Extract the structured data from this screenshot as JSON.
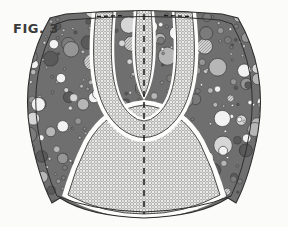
{
  "figure": {
    "label": "FIG. 3",
    "label_name": "figure-number-label",
    "caption_visible": true
  },
  "canvas": {
    "width": 288,
    "height": 227,
    "background_color": "#fbfbf9"
  },
  "colors": {
    "background": "#fbfbf9",
    "outline": "#2e2e2e",
    "aggregate_matrix": "#6f6f6f",
    "aggregate_dark": "#5a5a5a",
    "aggregate_mid": "#8d8d8d",
    "aggregate_light": "#c9c9c9",
    "aggregate_white": "#fafafa",
    "stipple_fill": "#ededea",
    "stipple_dot": "#8b8b8b",
    "white_band": "#fdfdfc",
    "centerline": "#1a1a1a"
  },
  "regions": [
    {
      "id": "outer-shell-left",
      "name": "aggregate-region-left",
      "fill": "aggregate",
      "description": "Left lobe filled with randomly sized circular aggregate particles"
    },
    {
      "id": "outer-shell-right",
      "name": "aggregate-region-right",
      "fill": "aggregate",
      "description": "Right lobe filled with randomly sized circular aggregate particles"
    },
    {
      "id": "aggregate-core-center",
      "name": "aggregate-region-center",
      "fill": "aggregate",
      "description": "Central wedge of aggregate between the inner U channel arms"
    },
    {
      "id": "lower-dome",
      "name": "stipple-region-lower-dome",
      "fill": "stipple",
      "description": "Large stippled dome occupying the lower half"
    },
    {
      "id": "u-channel-outer",
      "name": "stipple-region-u-channel",
      "fill": "stipple",
      "description": "U shaped stippled channel descending from the top and curving back"
    },
    {
      "id": "center-channel",
      "name": "stipple-region-center-channel",
      "fill": "stipple",
      "description": "Narrow stippled channel along the vertical axis at the top"
    }
  ],
  "centerline": {
    "name": "center-axis-dashed-line",
    "style": "dashed",
    "orientation": "vertical",
    "x": 144,
    "y_top": 14,
    "y_bottom": 214
  },
  "top_dashes": [
    {
      "name": "top-dash-left",
      "x1": 96,
      "x2": 124,
      "y": 16
    },
    {
      "name": "top-dash-right",
      "x1": 164,
      "x2": 192,
      "y": 16
    }
  ],
  "aggregate_particles": {
    "count_approx": 420,
    "min_radius": 1.2,
    "max_radius": 9.5,
    "shade_palette": [
      "#5a5a5a",
      "#7b7b7b",
      "#969696",
      "#b6b6b6",
      "#d6d6d6",
      "#f2f2f2"
    ]
  }
}
